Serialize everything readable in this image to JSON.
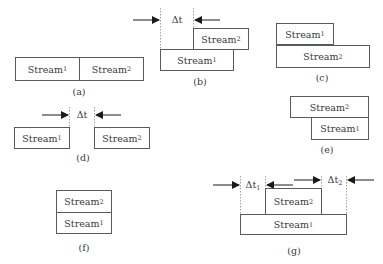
{
  "diagram": {
    "type": "stream-timing-relations",
    "stream_label": "Stream",
    "delta_label": "Δt",
    "panels": {
      "a": {
        "caption": "(a)",
        "streams": [
          {
            "name": "Stream",
            "index": "1"
          },
          {
            "name": "Stream",
            "index": "2"
          }
        ]
      },
      "b": {
        "caption": "(b)",
        "delta": {
          "symbol": "Δt",
          "index": ""
        },
        "streams": [
          {
            "name": "Stream",
            "index": "2"
          },
          {
            "name": "Stream",
            "index": "1"
          }
        ]
      },
      "c": {
        "caption": "(c)",
        "streams": [
          {
            "name": "Stream",
            "index": "1"
          },
          {
            "name": "Stream",
            "index": "2"
          }
        ]
      },
      "d": {
        "caption": "(d)",
        "delta": {
          "symbol": "Δt",
          "index": ""
        },
        "streams": [
          {
            "name": "Stream",
            "index": "1"
          },
          {
            "name": "Stream",
            "index": "2"
          }
        ]
      },
      "e": {
        "caption": "(e)",
        "streams": [
          {
            "name": "Stream",
            "index": "2"
          },
          {
            "name": "Stream",
            "index": "1"
          }
        ]
      },
      "f": {
        "caption": "(f)",
        "streams": [
          {
            "name": "Stream",
            "index": "2"
          },
          {
            "name": "Stream",
            "index": "1"
          }
        ]
      },
      "g": {
        "caption": "(g)",
        "deltas": [
          {
            "symbol": "Δt",
            "index": "1"
          },
          {
            "symbol": "Δt",
            "index": "2"
          }
        ],
        "streams": [
          {
            "name": "Stream",
            "index": "2"
          },
          {
            "name": "Stream",
            "index": "1"
          }
        ]
      }
    },
    "colors": {
      "line": "#5a5a5a",
      "text": "#3a3a3a",
      "arrow": "#1a1a1a",
      "dashed": "#8a8a8a"
    }
  }
}
